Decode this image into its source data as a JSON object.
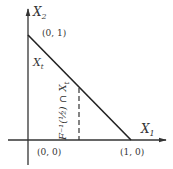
{
  "diagram": {
    "axes": {
      "x_label": "X",
      "x_sub": "1",
      "y_label": "X",
      "y_sub": "2"
    },
    "points": {
      "top": "(0, 1)",
      "origin": "(0, 0)",
      "right": "(1, 0)"
    },
    "region_label": "X",
    "region_sub": "t",
    "dashed_label": "F⁻¹(½) ∩ X",
    "dashed_label_sub": "t",
    "colors": {
      "line": "#222222",
      "axis": "#333333",
      "text": "#333333",
      "background": "#ffffff"
    }
  }
}
